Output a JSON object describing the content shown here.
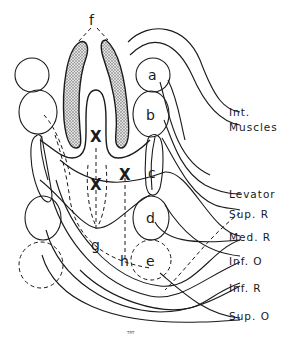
{
  "diagram": {
    "type": "anatomical schematic (extraocular muscle primordia)",
    "letters": {
      "a": "a",
      "b": "b",
      "c": "c",
      "d": "d",
      "e": "e",
      "f": "f",
      "g": "g",
      "h": "h"
    },
    "markers": [
      "X",
      "X",
      "X"
    ],
    "labels": {
      "int_muscles_1": "Int.",
      "int_muscles_2": "Muscles",
      "levator": "Levator",
      "sup_r": "Sup. R",
      "med_r": "Med. R",
      "inf_o": "Inf. O",
      "inf_r": "Inf. R",
      "sup_o": "Sup. O"
    },
    "signature": "TRT",
    "colors": {
      "stroke": "#1a1a1a",
      "shading": "#bdbdbd",
      "background": "#ffffff"
    }
  }
}
